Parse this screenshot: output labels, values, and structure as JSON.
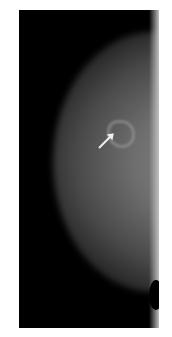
{
  "image": {
    "type": "mammogram",
    "view": "mediolateral",
    "annotation": "arrow-pointing-to-lesion",
    "colors": {
      "background": "#ffffff",
      "frame": "#000000",
      "tissue": "#7a7a7a",
      "arrow": "#eeeeee"
    }
  }
}
